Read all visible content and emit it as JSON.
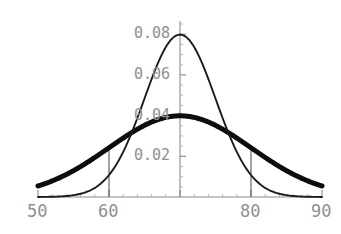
{
  "chart_data": {
    "type": "line",
    "title": "",
    "subtitle": "",
    "xlabel": "",
    "ylabel": "",
    "xlim": [
      50,
      90
    ],
    "ylim": [
      0,
      0.0855
    ],
    "grid": false,
    "legend": "none",
    "x_ticks": [
      50,
      60,
      70,
      80,
      90
    ],
    "x_tick_labels": [
      "50",
      "60",
      "",
      "80",
      "90"
    ],
    "x_minor_tick_step": 2,
    "y_ticks": [
      0.02,
      0.04,
      0.06,
      0.08
    ],
    "y_tick_labels": [
      "0.02",
      "0.04",
      "0.06",
      "0.08"
    ],
    "y_minor_tick_step": 0.005,
    "y_axis_x_position": 70,
    "annotations": [
      {
        "name": "drop-line-60",
        "type": "vertical-line",
        "x": 60,
        "y_from": 0,
        "y_to": 0.0242
      },
      {
        "name": "drop-line-80",
        "type": "vertical-line",
        "x": 80,
        "y_from": 0,
        "y_to": 0.0242
      }
    ],
    "series": [
      {
        "name": "narrow-normal",
        "style": "thin",
        "color": "#1a1a1a",
        "distribution": "normal",
        "mean": 70,
        "sigma": 5,
        "peak_value": 0.0798,
        "x": [
          50,
          52,
          54,
          56,
          58,
          60,
          62,
          64,
          66,
          68,
          70,
          72,
          74,
          76,
          78,
          80,
          82,
          84,
          86,
          88,
          90
        ],
        "values": [
          1.08e-05,
          8.73e-05,
          0.000536,
          0.00258,
          0.00968,
          0.0108,
          0.0227,
          0.0388,
          0.0579,
          0.0736,
          0.0798,
          0.0736,
          0.0579,
          0.0388,
          0.0227,
          0.0108,
          0.00403,
          0.00118,
          0.000268,
          4.77e-05,
          1.08e-05
        ]
      },
      {
        "name": "wide-normal",
        "style": "thick",
        "color": "#0d0d0d",
        "distribution": "normal",
        "mean": 70,
        "sigma": 10,
        "peak_value": 0.0399,
        "x": [
          50,
          52,
          54,
          56,
          58,
          60,
          62,
          64,
          66,
          68,
          70,
          72,
          74,
          76,
          78,
          80,
          82,
          84,
          86,
          88,
          90
        ],
        "values": [
          0.0054,
          0.0079,
          0.011,
          0.0145,
          0.0194,
          0.0242,
          0.029,
          0.0333,
          0.0368,
          0.0391,
          0.0399,
          0.0391,
          0.0368,
          0.0333,
          0.029,
          0.0242,
          0.0194,
          0.0145,
          0.011,
          0.0079,
          0.0054
        ]
      }
    ],
    "colors": {
      "background": "#ffffff",
      "axis": "#8a8a8a",
      "tick_label": "#8f8f8f",
      "curve_thin": "#1a1a1a",
      "curve_thick": "#0d0d0d",
      "drop_line": "#5a5a5a"
    }
  }
}
